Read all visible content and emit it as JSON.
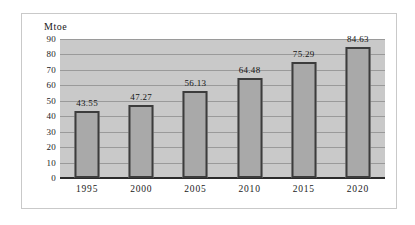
{
  "chart_data": {
    "type": "bar",
    "title": "",
    "xlabel": "",
    "ylabel": "Mtoe",
    "categories": [
      "1995",
      "2000",
      "2005",
      "2010",
      "2015",
      "2020"
    ],
    "values": [
      43.55,
      47.27,
      56.13,
      64.48,
      75.29,
      84.63
    ],
    "data_labels": [
      "43.55",
      "47.27",
      "56.13",
      "64.48",
      "75.29",
      "84.63"
    ],
    "ylim": [
      0,
      90
    ],
    "ytick_values": [
      0,
      10,
      20,
      30,
      40,
      50,
      60,
      70,
      80,
      90
    ],
    "ytick_labels": [
      "0",
      "10",
      "20",
      "30",
      "40",
      "50",
      "60",
      "70",
      "80",
      "90"
    ],
    "grid": "horizontal",
    "legend": "none",
    "colors": {
      "bar_fill": "#a9a9a9",
      "bar_border": "#3c3c3c",
      "plot_background": "#c9c9c9",
      "gridline": "#9a9a9a",
      "axis_line": "#2b2b2b",
      "frame_border": "#c9c9c9",
      "text": "#1a1a1a",
      "page_background": "#ffffff"
    }
  }
}
